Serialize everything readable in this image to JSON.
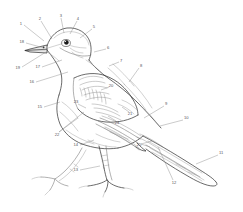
{
  "figure": {
    "style": "black and white line art with numbered callouts",
    "background_color": "#ffffff",
    "line_color": "#2b2b2b",
    "label_color": "#55555a"
  },
  "labels": [
    {
      "id": "1",
      "text": "1",
      "x": 22,
      "y": 24,
      "anchor": "end",
      "leader": "M 24 25 L 44 41"
    },
    {
      "id": "2",
      "text": "2",
      "x": 40,
      "y": 19,
      "anchor": "middle",
      "leader": "M 41 21 L 52 39"
    },
    {
      "id": "3",
      "text": "3",
      "x": 61,
      "y": 16,
      "anchor": "middle",
      "leader": "M 61 18 L 64 33"
    },
    {
      "id": "4",
      "text": "4",
      "x": 78,
      "y": 19,
      "anchor": "middle",
      "leader": "M 77 21 L 70 34"
    },
    {
      "id": "5",
      "text": "5",
      "x": 94,
      "y": 27,
      "anchor": "middle",
      "leader": "M 92 29 L 80 38"
    },
    {
      "id": "6",
      "text": "6",
      "x": 107,
      "y": 48,
      "anchor": "start",
      "leader": "M 106 49 L 94 52"
    },
    {
      "id": "7",
      "text": "7",
      "x": 120,
      "y": 61,
      "anchor": "start",
      "leader": "M 119 62 L 109 66"
    },
    {
      "id": "8",
      "text": "8",
      "x": 140,
      "y": 66,
      "anchor": "start",
      "leader": "M 139 68 L 129 82"
    },
    {
      "id": "9",
      "text": "9",
      "x": 165,
      "y": 104,
      "anchor": "start",
      "leader": "M 164 106 L 144 118"
    },
    {
      "id": "10",
      "text": "10",
      "x": 184,
      "y": 118,
      "anchor": "start",
      "leader": "M 183 120 L 160 126"
    },
    {
      "id": "11",
      "text": "11",
      "x": 219,
      "y": 153,
      "anchor": "start",
      "leader": "M 218 155 L 196 164"
    },
    {
      "id": "12",
      "text": "12",
      "x": 174,
      "y": 182,
      "anchor": "middle",
      "leader": "M 173 180 L 158 147"
    },
    {
      "id": "13",
      "text": "13",
      "x": 78,
      "y": 170,
      "anchor": "end",
      "leader": "M 80 170 L 100 166"
    },
    {
      "id": "14",
      "text": "14",
      "x": 78,
      "y": 145,
      "anchor": "end",
      "leader": "M 80 145 L 94 140"
    },
    {
      "id": "15",
      "text": "15",
      "x": 42,
      "y": 107,
      "anchor": "end",
      "leader": "M 44 107 L 60 102"
    },
    {
      "id": "16",
      "text": "16",
      "x": 34,
      "y": 82,
      "anchor": "end",
      "leader": "M 36 82 L 68 72"
    },
    {
      "id": "17",
      "text": "17",
      "x": 40,
      "y": 67,
      "anchor": "end",
      "leader": "M 42 67 L 62 60"
    },
    {
      "id": "18",
      "text": "18",
      "x": 24,
      "y": 42,
      "anchor": "end",
      "leader": "M 26 43 L 44 48"
    },
    {
      "id": "19",
      "text": "19",
      "x": 20,
      "y": 68,
      "anchor": "end",
      "leader": "M 22 67 L 46 52"
    },
    {
      "id": "20",
      "text": "20",
      "x": 110,
      "y": 86,
      "anchor": "middle",
      "leader": "M 109 87 L 101 90"
    },
    {
      "id": "21",
      "text": "21",
      "x": 130,
      "y": 113,
      "anchor": "middle",
      "leader": "M 129 112 L 122 107"
    },
    {
      "id": "22",
      "text": "22",
      "x": 57,
      "y": 134,
      "anchor": "middle",
      "leader": "M 59 132 L 78 118"
    },
    {
      "id": "23",
      "text": "23",
      "x": 76,
      "y": 103,
      "anchor": "middle",
      "leader": "M 78 104 L 86 108"
    },
    {
      "id": "24",
      "text": "24",
      "x": 117,
      "y": 122,
      "anchor": "middle",
      "leader": "M 116 121 L 108 116"
    },
    {
      "id": "25",
      "text": "25",
      "x": 139,
      "y": 145,
      "anchor": "middle",
      "leader": "M 141 144 L 152 141"
    }
  ]
}
